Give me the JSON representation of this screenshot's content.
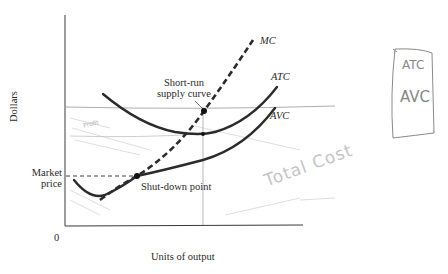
{
  "diagram": {
    "type": "economics-cost-curves",
    "axes": {
      "y_label": "Dollars",
      "x_label": "Units of output",
      "origin_label": "0"
    },
    "curves": [
      {
        "id": "mc",
        "label": "MC",
        "style": "dashed"
      },
      {
        "id": "atc",
        "label": "ATC",
        "style": "solid"
      },
      {
        "id": "avc",
        "label": "AVC",
        "style": "solid"
      }
    ],
    "annotations": {
      "market_price": [
        "Market",
        "price"
      ],
      "shutdown_point": "Shut-down point",
      "short_run_supply": [
        "Short-run",
        "supply curve"
      ]
    },
    "handwritten": {
      "box_line1": "ATC",
      "box_line2": "AVC",
      "scribble_profit": "Profit",
      "scribble_total_cost": "Total Cost"
    },
    "colors": {
      "curve": "#2b2b2b",
      "text": "#2a2a2a",
      "pencil": "#9a9a9a",
      "pencil_light": "#c8c8c8"
    }
  }
}
